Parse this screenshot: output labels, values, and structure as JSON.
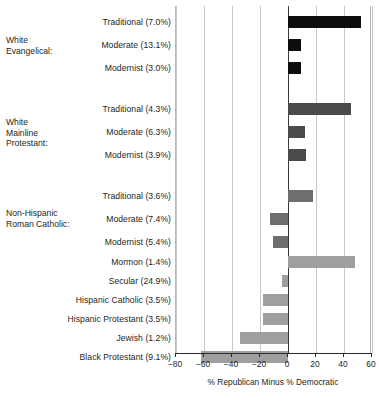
{
  "chart_data": {
    "type": "bar",
    "orientation": "horizontal",
    "title": "",
    "xlabel": "% Republican Minus % Democratic",
    "ylabel": "",
    "xlim": [
      -80,
      60
    ],
    "xticks": [
      -80,
      -60,
      -40,
      -20,
      0,
      20,
      40,
      60
    ],
    "xtick_labels": [
      "−80",
      "−60",
      "−40",
      "−20",
      "0",
      "20",
      "40",
      "60"
    ],
    "grid": true,
    "legend": "none",
    "zero_reference_line": 0,
    "groups": [
      {
        "name": "White Evangelical:",
        "label_lines": [
          "White",
          "Evangelical:"
        ],
        "color": "#0d0d0d",
        "categories": [
          {
            "label": "Traditional (7.0%)",
            "share": "7.0%",
            "value": 52
          },
          {
            "label": "Moderate (13.1%)",
            "share": "13.1%",
            "value": 9
          },
          {
            "label": "Modernist (3.0%)",
            "share": "3.0%",
            "value": 9
          }
        ]
      },
      {
        "name": "White Mainline Protestant:",
        "label_lines": [
          "White",
          "Mainline",
          "Protestant:"
        ],
        "color": "#4a4a4a",
        "categories": [
          {
            "label": "Traditional (4.3%)",
            "share": "4.3%",
            "value": 45
          },
          {
            "label": "Moderate (6.3%)",
            "share": "6.3%",
            "value": 12
          },
          {
            "label": "Modernist (3.9%)",
            "share": "3.9%",
            "value": 13
          }
        ]
      },
      {
        "name": "Non-Hispanic Roman Catholic:",
        "label_lines": [
          "Non-Hispanic",
          "Roman Catholic:"
        ],
        "color": "#6e6e6e",
        "categories": [
          {
            "label": "Traditional (3.6%)",
            "share": "3.6%",
            "value": 18
          },
          {
            "label": "Moderate (7.4%)",
            "share": "7.4%",
            "value": -13
          },
          {
            "label": "Modernist (5.4%)",
            "share": "5.4%",
            "value": -11
          }
        ]
      },
      {
        "name": "Other groups",
        "label_lines": [],
        "color": "#9f9f9f",
        "categories": [
          {
            "label": "Mormon (1.4%)",
            "share": "1.4%",
            "value": 48
          },
          {
            "label": "Secular (24.9%)",
            "share": "24.9%",
            "value": -4
          },
          {
            "label": "Hispanic Catholic (3.5%)",
            "share": "3.5%",
            "value": -18
          },
          {
            "label": "Hispanic Protestant (3.5%)",
            "share": "3.5%",
            "value": -18
          },
          {
            "label": "Jewish (1.2%)",
            "share": "1.2%",
            "value": -34
          },
          {
            "label": "Black Protestant (9.1%)",
            "share": "9.1%",
            "value": -62
          }
        ]
      }
    ]
  }
}
